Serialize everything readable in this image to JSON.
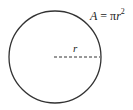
{
  "diagram": {
    "formula": {
      "lhs": "A",
      "eq": " = π",
      "var": "r",
      "exp": "2"
    },
    "radius_label": "r",
    "colors": {
      "stroke": "#333333",
      "background": "#ffffff"
    }
  }
}
